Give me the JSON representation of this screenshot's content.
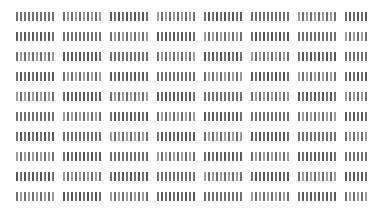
{
  "document": {
    "kind": "greeked-text-thumbnail",
    "description": "Low-resolution document preview in which text is rendered as illegible vertical tick strokes",
    "canvas": {
      "width": 386,
      "height": 217,
      "background_color": "#ffffff"
    },
    "layout": {
      "margin_left": 16,
      "margin_right": 17,
      "margin_top": 12,
      "margin_bottom": 16,
      "line_count": 10,
      "line_pitch": 20,
      "line_height": 9,
      "first_line_top": 12,
      "groups_per_line": 8,
      "group_gap": 7,
      "tick_width": 2,
      "tick_gap": 2
    },
    "ink": {
      "stroke_color": "#707070",
      "stroke_color_light": "#9a9a9a",
      "stroke_color_dark": "#5a5a5a"
    },
    "lines": [
      {
        "index": 1,
        "top": 12,
        "groups": [
          {
            "left": 16,
            "width": 40,
            "ticks": 10
          },
          {
            "left": 63,
            "width": 40,
            "ticks": 10
          },
          {
            "left": 110,
            "width": 40,
            "ticks": 10
          },
          {
            "left": 157,
            "width": 40,
            "ticks": 10
          },
          {
            "left": 204,
            "width": 40,
            "ticks": 10
          },
          {
            "left": 251,
            "width": 40,
            "ticks": 10
          },
          {
            "left": 298,
            "width": 40,
            "ticks": 10
          },
          {
            "left": 345,
            "width": 24,
            "ticks": 6
          }
        ]
      },
      {
        "index": 2,
        "top": 32,
        "groups": [
          {
            "left": 16,
            "width": 40,
            "ticks": 10
          },
          {
            "left": 63,
            "width": 40,
            "ticks": 10
          },
          {
            "left": 110,
            "width": 40,
            "ticks": 10
          },
          {
            "left": 157,
            "width": 40,
            "ticks": 10
          },
          {
            "left": 204,
            "width": 40,
            "ticks": 10
          },
          {
            "left": 251,
            "width": 40,
            "ticks": 10
          },
          {
            "left": 298,
            "width": 40,
            "ticks": 10
          },
          {
            "left": 345,
            "width": 24,
            "ticks": 6
          }
        ]
      },
      {
        "index": 3,
        "top": 52,
        "groups": [
          {
            "left": 16,
            "width": 40,
            "ticks": 10
          },
          {
            "left": 63,
            "width": 40,
            "ticks": 10
          },
          {
            "left": 110,
            "width": 40,
            "ticks": 10
          },
          {
            "left": 157,
            "width": 40,
            "ticks": 10
          },
          {
            "left": 204,
            "width": 40,
            "ticks": 10
          },
          {
            "left": 251,
            "width": 40,
            "ticks": 10
          },
          {
            "left": 298,
            "width": 40,
            "ticks": 10
          },
          {
            "left": 345,
            "width": 24,
            "ticks": 6
          }
        ]
      },
      {
        "index": 4,
        "top": 72,
        "groups": [
          {
            "left": 16,
            "width": 40,
            "ticks": 10
          },
          {
            "left": 63,
            "width": 40,
            "ticks": 10
          },
          {
            "left": 110,
            "width": 40,
            "ticks": 10
          },
          {
            "left": 157,
            "width": 40,
            "ticks": 10
          },
          {
            "left": 204,
            "width": 40,
            "ticks": 10
          },
          {
            "left": 251,
            "width": 40,
            "ticks": 10
          },
          {
            "left": 298,
            "width": 40,
            "ticks": 10
          },
          {
            "left": 345,
            "width": 24,
            "ticks": 6
          }
        ]
      },
      {
        "index": 5,
        "top": 92,
        "groups": [
          {
            "left": 16,
            "width": 40,
            "ticks": 10
          },
          {
            "left": 63,
            "width": 40,
            "ticks": 10
          },
          {
            "left": 110,
            "width": 40,
            "ticks": 10
          },
          {
            "left": 157,
            "width": 40,
            "ticks": 10
          },
          {
            "left": 204,
            "width": 40,
            "ticks": 10
          },
          {
            "left": 251,
            "width": 40,
            "ticks": 10
          },
          {
            "left": 298,
            "width": 40,
            "ticks": 10
          },
          {
            "left": 345,
            "width": 24,
            "ticks": 6
          }
        ]
      },
      {
        "index": 6,
        "top": 112,
        "groups": [
          {
            "left": 16,
            "width": 40,
            "ticks": 10
          },
          {
            "left": 63,
            "width": 40,
            "ticks": 10
          },
          {
            "left": 110,
            "width": 40,
            "ticks": 10
          },
          {
            "left": 157,
            "width": 40,
            "ticks": 10
          },
          {
            "left": 204,
            "width": 40,
            "ticks": 10
          },
          {
            "left": 251,
            "width": 40,
            "ticks": 10
          },
          {
            "left": 298,
            "width": 40,
            "ticks": 10
          },
          {
            "left": 345,
            "width": 24,
            "ticks": 6
          }
        ]
      },
      {
        "index": 7,
        "top": 132,
        "groups": [
          {
            "left": 16,
            "width": 40,
            "ticks": 10
          },
          {
            "left": 63,
            "width": 40,
            "ticks": 10
          },
          {
            "left": 110,
            "width": 40,
            "ticks": 10
          },
          {
            "left": 157,
            "width": 40,
            "ticks": 10
          },
          {
            "left": 204,
            "width": 40,
            "ticks": 10
          },
          {
            "left": 251,
            "width": 40,
            "ticks": 10
          },
          {
            "left": 298,
            "width": 40,
            "ticks": 10
          },
          {
            "left": 345,
            "width": 24,
            "ticks": 6
          }
        ]
      },
      {
        "index": 8,
        "top": 152,
        "groups": [
          {
            "left": 16,
            "width": 40,
            "ticks": 10
          },
          {
            "left": 63,
            "width": 40,
            "ticks": 10
          },
          {
            "left": 110,
            "width": 40,
            "ticks": 10
          },
          {
            "left": 157,
            "width": 40,
            "ticks": 10
          },
          {
            "left": 204,
            "width": 40,
            "ticks": 10
          },
          {
            "left": 251,
            "width": 40,
            "ticks": 10
          },
          {
            "left": 298,
            "width": 40,
            "ticks": 10
          },
          {
            "left": 345,
            "width": 24,
            "ticks": 6
          }
        ]
      },
      {
        "index": 9,
        "top": 172,
        "groups": [
          {
            "left": 16,
            "width": 40,
            "ticks": 10
          },
          {
            "left": 63,
            "width": 40,
            "ticks": 10
          },
          {
            "left": 110,
            "width": 40,
            "ticks": 10
          },
          {
            "left": 157,
            "width": 40,
            "ticks": 10
          },
          {
            "left": 204,
            "width": 40,
            "ticks": 10
          },
          {
            "left": 251,
            "width": 40,
            "ticks": 10
          },
          {
            "left": 298,
            "width": 40,
            "ticks": 10
          },
          {
            "left": 345,
            "width": 24,
            "ticks": 6
          }
        ]
      },
      {
        "index": 10,
        "top": 192,
        "groups": [
          {
            "left": 16,
            "width": 40,
            "ticks": 10
          },
          {
            "left": 63,
            "width": 40,
            "ticks": 10
          },
          {
            "left": 110,
            "width": 40,
            "ticks": 10
          },
          {
            "left": 157,
            "width": 40,
            "ticks": 10
          },
          {
            "left": 204,
            "width": 40,
            "ticks": 10
          },
          {
            "left": 251,
            "width": 40,
            "ticks": 10
          },
          {
            "left": 298,
            "width": 40,
            "ticks": 10
          },
          {
            "left": 345,
            "width": 24,
            "ticks": 6
          }
        ]
      }
    ]
  }
}
